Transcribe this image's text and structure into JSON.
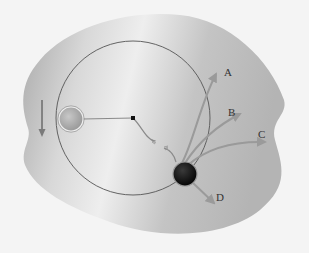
{
  "diagram": {
    "colors": {
      "background": "#f4f4f4",
      "surface_light": "#e6e6e6",
      "surface_dark": "#b8b8b8",
      "orbit_line": "#555555",
      "string": "#8a8a8a",
      "arrow": "#9a9a9a",
      "ball_light": "#b0b0b0",
      "ball_dark": "#151515",
      "label": "#333333"
    },
    "orbit": {
      "cx": 133,
      "cy": 118,
      "r": 77
    },
    "center_pin": {
      "cx": 133,
      "cy": 118
    },
    "ball_start": {
      "cx": 71,
      "cy": 119,
      "r": 12,
      "label": ""
    },
    "ball_release": {
      "cx": 185,
      "cy": 174,
      "r": 12
    },
    "motion_arrow": {
      "direction": "down"
    },
    "trajectories": [
      {
        "id": "A",
        "label": "A"
      },
      {
        "id": "B",
        "label": "B"
      },
      {
        "id": "C",
        "label": "C"
      },
      {
        "id": "D",
        "label": "D"
      }
    ]
  }
}
